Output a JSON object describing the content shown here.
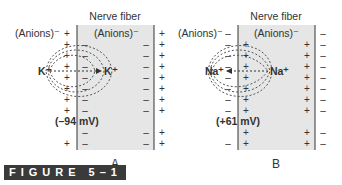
{
  "figure_caption": "FIGURE 5–1",
  "colors": {
    "fiber_fill": "#e6e6e6",
    "line": "#333333",
    "dash": "#555555"
  },
  "panels": [
    {
      "label": "A",
      "title": "Nerve fiber",
      "outside_anion_label": "(Anions)⁻",
      "inside_anion_label": "(Anions)⁻",
      "ion_outside": "K⁺",
      "ion_inside": "K⁺",
      "potential": "(–94 mV)",
      "outer_sign": "+",
      "membrane_inner_sign": "–",
      "right_membrane_inner_sign": "–",
      "right_outer_sign": "+",
      "diffusion_direction": "outward-to-inward arrow"
    },
    {
      "label": "B",
      "title": "Nerve fiber",
      "outside_anion_label": "(Anions)⁻",
      "inside_anion_label": "(Anions)⁻",
      "ion_outside": "Na⁺",
      "ion_inside": "Na⁺",
      "potential": "(+61 mV)",
      "outer_sign": "–",
      "membrane_inner_sign": "+",
      "right_membrane_inner_sign": "+",
      "right_outer_sign": "–",
      "diffusion_direction": "inward-to-outward arrow"
    }
  ]
}
